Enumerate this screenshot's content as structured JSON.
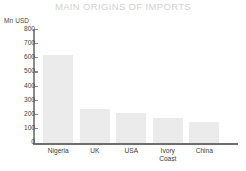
{
  "chart_data": {
    "type": "bar",
    "title": "MAIN ORIGINS OF IMPORTS",
    "xlabel": "",
    "ylabel": "Mn USD",
    "categories": [
      "Nigeria",
      "UK",
      "USA",
      "Ivory\nCoast",
      "China"
    ],
    "values": [
      620,
      240,
      215,
      175,
      150
    ],
    "ylim": [
      0,
      800
    ],
    "ytick_labels": [
      "800",
      "700",
      "600",
      "500",
      "400",
      "300",
      "200",
      "100",
      "0"
    ],
    "ytick_values": [
      800,
      700,
      600,
      500,
      400,
      300,
      200,
      100,
      0
    ],
    "ytick_step": 100,
    "grid": false,
    "legend": false,
    "bar_color": "#ebebeb",
    "title_color": "#d2d2d2",
    "axis_color": "#8a8a8a",
    "text_color": "#3a3a3a",
    "background_color": "#ffffff"
  }
}
